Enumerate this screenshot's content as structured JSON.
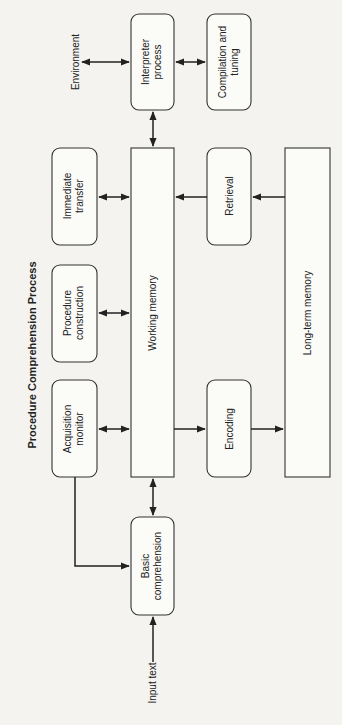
{
  "diagram": {
    "title": "Procedure Comprehension Process",
    "nodes": {
      "environment": {
        "label": "Environment"
      },
      "interpreter": {
        "line1": "Interpreter",
        "line2": "process"
      },
      "compilation": {
        "line1": "Compilation and",
        "line2": "tuning"
      },
      "immediate": {
        "line1": "Immediate",
        "line2": "transfer"
      },
      "working": {
        "label": "Working memory"
      },
      "retrieval": {
        "label": "Retrieval"
      },
      "longterm": {
        "label": "Long-term memory"
      },
      "procedure": {
        "line1": "Procedure",
        "line2": "construction"
      },
      "acquisition": {
        "line1": "Acquisition",
        "line2": "monitor"
      },
      "encoding": {
        "label": "Encoding"
      },
      "basic": {
        "line1": "Basic",
        "line2": "comprehension"
      },
      "input": {
        "label": "Input text"
      }
    },
    "edges": [
      {
        "from": "Environment",
        "to": "Interpreter process",
        "type": "bidirectional"
      },
      {
        "from": "Interpreter process",
        "to": "Compilation and tuning",
        "type": "bidirectional"
      },
      {
        "from": "Interpreter process",
        "to": "Working memory",
        "type": "bidirectional"
      },
      {
        "from": "Immediate transfer",
        "to": "Working memory",
        "type": "bidirectional"
      },
      {
        "from": "Retrieval",
        "to": "Working memory",
        "type": "directed"
      },
      {
        "from": "Long-term memory",
        "to": "Retrieval",
        "type": "directed"
      },
      {
        "from": "Procedure construction",
        "to": "Working memory",
        "type": "bidirectional"
      },
      {
        "from": "Acquisition monitor",
        "to": "Working memory",
        "type": "bidirectional"
      },
      {
        "from": "Working memory",
        "to": "Encoding",
        "type": "directed"
      },
      {
        "from": "Encoding",
        "to": "Long-term memory",
        "type": "directed"
      },
      {
        "from": "Working memory",
        "to": "Basic comprehension",
        "type": "bidirectional"
      },
      {
        "from": "Acquisition monitor",
        "to": "Basic comprehension",
        "type": "directed"
      },
      {
        "from": "Input text",
        "to": "Basic comprehension",
        "type": "directed"
      }
    ]
  }
}
